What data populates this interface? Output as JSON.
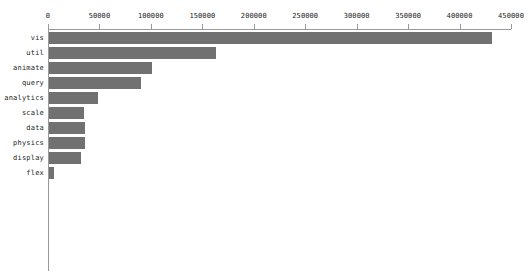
{
  "chart_data": {
    "type": "bar",
    "orientation": "horizontal",
    "title": "",
    "subtitle": "",
    "xlabel": "",
    "ylabel": "",
    "categories": [
      "vis",
      "util",
      "animate",
      "query",
      "analytics",
      "scale",
      "data",
      "physics",
      "display",
      "flex"
    ],
    "values": [
      430500,
      162700,
      100300,
      89600,
      47700,
      34100,
      35000,
      35000,
      31200,
      4900
    ],
    "xlim": [
      0,
      450000
    ],
    "ylim": null,
    "xticks": [
      0,
      50000,
      100000,
      150000,
      200000,
      250000,
      300000,
      350000,
      400000,
      450000
    ],
    "xtick_labels": [
      "0",
      "50000",
      "100000",
      "150000",
      "200000",
      "250000",
      "300000",
      "350000",
      "400000",
      "450000"
    ],
    "grid": false,
    "legend": null,
    "legend_position": "none",
    "bar_color": "#717171",
    "axis_color": "#9a9a9a",
    "text_color": "#1b1b1b",
    "background": "#ffffff"
  }
}
